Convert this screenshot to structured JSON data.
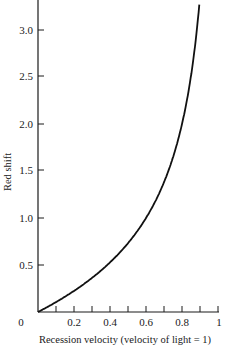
{
  "chart_data": {
    "type": "line",
    "title": "",
    "xlabel": "Recession velocity (velocity of light = 1)",
    "ylabel": "Red shift",
    "xlim": [
      0,
      1
    ],
    "ylim": [
      0,
      3.3
    ],
    "grid": false,
    "legend": null,
    "x_ticks": [
      0.1,
      0.2,
      0.3,
      0.4,
      0.5,
      0.6,
      0.7,
      0.8,
      0.9,
      1.0
    ],
    "x_tick_labels": [
      "0",
      "0.2",
      "0.4",
      "0.6",
      "0.8",
      "1"
    ],
    "y_ticks": [
      0.5,
      1.0,
      1.5,
      2.0,
      2.5,
      3.0
    ],
    "y_tick_labels": [
      "0.5",
      "1.0",
      "1.5",
      "2.0",
      "2.5",
      "3.0"
    ],
    "series": [
      {
        "name": "Relativistic Doppler red shift",
        "x": [
          0,
          0.1,
          0.2,
          0.3,
          0.4,
          0.5,
          0.6,
          0.7,
          0.8,
          0.85,
          0.9,
          0.91
        ],
        "values": [
          0,
          0.11,
          0.22,
          0.36,
          0.53,
          0.73,
          1.0,
          1.38,
          2.0,
          2.51,
          3.36,
          3.6
        ]
      }
    ]
  },
  "labels": {
    "origin": "0",
    "x_02": "0.2",
    "x_04": "0.4",
    "x_06": "0.6",
    "x_08": "0.8",
    "x_10": "1",
    "y_05": "0.5",
    "y_10": "1.0",
    "y_15": "1.5",
    "y_20": "2.0",
    "y_25": "2.5",
    "y_30": "3.0",
    "xlabel": "Recession velocity (velocity of light = 1)",
    "ylabel": "Red shift"
  }
}
